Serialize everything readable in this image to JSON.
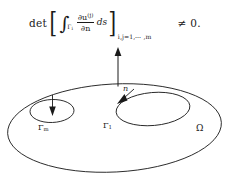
{
  "figure": {
    "type": "math-domain-diagram",
    "background_color": "#ffffff",
    "ink_color": "#1a1a1a"
  },
  "formula": {
    "determinant_label": "det",
    "bracket_left": "[",
    "bracket_right": "]",
    "integral_sign": "∫",
    "integral_subscript_base": "Γ",
    "integral_subscript_index": "i",
    "numerator_partial": "∂u",
    "numerator_superscript": "(j)",
    "denominator": "∂n",
    "differential": "ds",
    "matrix_subscript": "i,j=1,⋯ ,m",
    "relation": "≠ 0.",
    "full_text": "det [ ∫_{Γ_i} ∂u^{(j)}/∂n ds ]_{i,j=1,⋯,m} ≠ 0."
  },
  "diagram": {
    "normal_vector": {
      "label": "n",
      "description": "outward unit normal arrow at top of outer boundary"
    },
    "outer_boundary": {
      "label": "Γ0",
      "label_base": "Γ",
      "label_sub": "0"
    },
    "inner_boundary_left": {
      "label_base": "Γ",
      "label_sub": "m"
    },
    "inner_boundary_right": {
      "label_base": "Γ",
      "label_sub": "1"
    },
    "region": {
      "label": "Ω"
    }
  }
}
